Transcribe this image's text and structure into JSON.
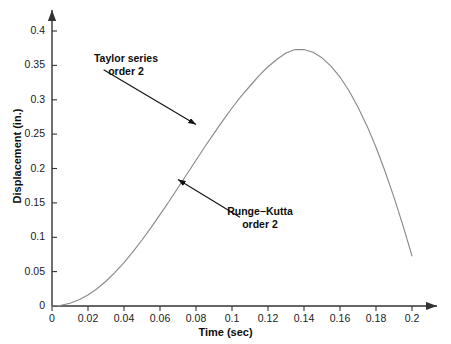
{
  "chart_data": {
    "type": "line",
    "title": "",
    "xlabel": "Time (sec)",
    "ylabel": "Displacement (in.)",
    "xlim": [
      0,
      0.2
    ],
    "ylim": [
      0,
      0.4
    ],
    "grid": false,
    "legend_position": "none",
    "xticks": [
      "0",
      "0.02",
      "0.04",
      "0.06",
      "0.08",
      "0.1",
      "0.12",
      "0.14",
      "0.16",
      "0.18",
      "0.2"
    ],
    "xtick_values": [
      0,
      0.02,
      0.04,
      0.06,
      0.08,
      0.1,
      0.12,
      0.14,
      0.16,
      0.18,
      0.2
    ],
    "yticks": [
      "0",
      "0.05",
      "0.1",
      "0.15",
      "0.2",
      "0.25",
      "0.3",
      "0.35",
      "0.4"
    ],
    "ytick_values": [
      0,
      0.05,
      0.1,
      0.15,
      0.2,
      0.25,
      0.3,
      0.35,
      0.4
    ],
    "series": [
      {
        "name": "Taylor series order 2 / Runge-Kutta order 2 (overlapping)",
        "color": "#8a8a8a",
        "x": [
          0,
          0.005,
          0.01,
          0.015,
          0.02,
          0.025,
          0.03,
          0.035,
          0.04,
          0.045,
          0.05,
          0.055,
          0.06,
          0.065,
          0.07,
          0.075,
          0.08,
          0.085,
          0.09,
          0.095,
          0.1,
          0.105,
          0.11,
          0.115,
          0.12,
          0.125,
          0.13,
          0.135,
          0.14,
          0.145,
          0.15,
          0.155,
          0.16,
          0.165,
          0.17,
          0.175,
          0.18,
          0.185,
          0.19,
          0.195,
          0.2
        ],
        "values": [
          0.0,
          0.001,
          0.004,
          0.009,
          0.016,
          0.025,
          0.036,
          0.049,
          0.063,
          0.079,
          0.096,
          0.114,
          0.133,
          0.152,
          0.172,
          0.192,
          0.212,
          0.232,
          0.251,
          0.27,
          0.288,
          0.305,
          0.32,
          0.335,
          0.348,
          0.359,
          0.368,
          0.373,
          0.373,
          0.369,
          0.361,
          0.349,
          0.333,
          0.313,
          0.289,
          0.262,
          0.231,
          0.196,
          0.158,
          0.117,
          0.073
        ]
      }
    ],
    "annotations": [
      {
        "id": "taylor",
        "line1": "Taylor series",
        "line2": "order 2",
        "arrow_from": [
          0.0287,
          0.3437
        ],
        "arrow_to": [
          0.08,
          0.264
        ]
      },
      {
        "id": "runge-kutta",
        "line1": "Runge−Kutta",
        "line2": "order 2",
        "arrow_from": [
          0.1044,
          0.129
        ],
        "arrow_to": [
          0.07,
          0.184
        ]
      }
    ],
    "axis_color": "#333333",
    "text_color": "#0d0d0d"
  }
}
